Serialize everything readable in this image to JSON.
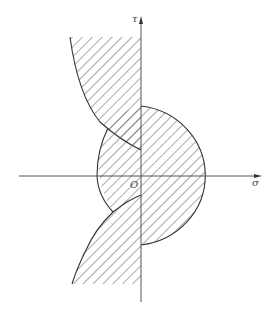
{
  "diagram": {
    "axis_labels": {
      "vertical": "τ",
      "horizontal": "σ",
      "origin": "O"
    },
    "colors": {
      "stroke": "#333333",
      "hatch": "#555555",
      "axis": "#555555",
      "background": "#ffffff"
    },
    "regions": [
      {
        "name": "upper-left-hatched-region",
        "description": "region left of τ axis above the concave arc"
      },
      {
        "name": "right-semicircle-region",
        "description": "circle region right of τ axis"
      },
      {
        "name": "left-lens-region",
        "description": "circle region left of τ axis"
      },
      {
        "name": "lower-left-hatched-region",
        "description": "region left of τ axis below the convex arc"
      }
    ]
  }
}
